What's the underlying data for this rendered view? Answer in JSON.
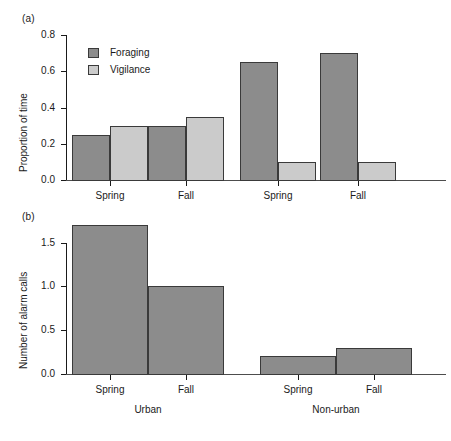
{
  "figure": {
    "panel_a_tag": "(a)",
    "panel_b_tag": "(b)"
  },
  "panel_a": {
    "ylabel": "Proportion of time",
    "ytick_labels": [
      "0.0",
      "0.2",
      "0.4",
      "0.6",
      "0.8"
    ],
    "xtick_labels": [
      "Spring",
      "Fall",
      "Spring",
      "Fall"
    ],
    "legend": [
      {
        "label": "Foraging",
        "color": "#8c8c8c"
      },
      {
        "label": "Vigilance",
        "color": "#cbcbcb"
      }
    ]
  },
  "panel_b": {
    "ylabel": "Number of alarm calls",
    "ytick_labels": [
      "0.0",
      "0.5",
      "1.0",
      "1.5"
    ],
    "xtick_labels": [
      "Spring",
      "Fall",
      "Spring",
      "Fall"
    ],
    "group_labels": [
      "Urban",
      "Non-urban"
    ]
  },
  "chart_data": [
    {
      "type": "bar",
      "title": "(a)",
      "xlabel": "",
      "ylabel": "Proportion of time",
      "ylim": [
        0.0,
        0.8
      ],
      "yticks": [
        0.0,
        0.2,
        0.4,
        0.6,
        0.8
      ],
      "grid": false,
      "legend_position": "top-left",
      "categories": [
        "Spring",
        "Fall",
        "Spring",
        "Fall"
      ],
      "group_context": [
        "Urban",
        "Urban",
        "Non-urban",
        "Non-urban"
      ],
      "series": [
        {
          "name": "Foraging",
          "color": "#8c8c8c",
          "values": [
            0.25,
            0.3,
            0.65,
            0.7
          ]
        },
        {
          "name": "Vigilance",
          "color": "#cbcbcb",
          "values": [
            0.3,
            0.35,
            0.1,
            0.1
          ]
        }
      ]
    },
    {
      "type": "bar",
      "title": "(b)",
      "xlabel": "",
      "ylabel": "Number of alarm calls",
      "ylim": [
        0.0,
        1.7
      ],
      "yticks": [
        0.0,
        0.5,
        1.0,
        1.5
      ],
      "grid": false,
      "legend_position": "none",
      "categories": [
        "Spring",
        "Fall",
        "Spring",
        "Fall"
      ],
      "groups": [
        "Urban",
        "Non-urban"
      ],
      "series": [
        {
          "name": "Number of alarm calls",
          "color": "#8c8c8c",
          "values": [
            1.7,
            1.0,
            0.2,
            0.3
          ]
        }
      ]
    }
  ]
}
